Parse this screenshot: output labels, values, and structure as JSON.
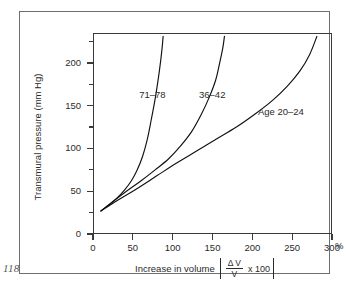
{
  "page": {
    "folio": "118"
  },
  "chart_data": {
    "type": "line",
    "title": "",
    "xlabel": "Increase in volume",
    "xlabel_bracket": {
      "numerator": "Δ V",
      "denominator": "V",
      "multiplier": "x 100"
    },
    "x_unit": "%",
    "ylabel": "Transmural pressure (mm Hg)",
    "xlim": [
      0,
      300
    ],
    "ylim": [
      0,
      235
    ],
    "xticks": [
      0,
      50,
      100,
      150,
      200,
      250,
      300
    ],
    "xtick_labels": [
      "0",
      "50",
      "100",
      "150",
      "200",
      "250",
      "300"
    ],
    "yticks": [
      0,
      50,
      100,
      150,
      200
    ],
    "ytick_labels": [
      "0",
      "50",
      "100",
      "150",
      "200"
    ],
    "y_minor_ticks": [
      25,
      75,
      125,
      175,
      225
    ],
    "grid": false,
    "legend_position": "inline-annotations",
    "series": [
      {
        "name": "71–78",
        "label": "71–78",
        "label_x": 58,
        "label_y": 163,
        "x": [
          10,
          20,
          30,
          40,
          48,
          55,
          62,
          68,
          73,
          78,
          82,
          85,
          87,
          88
        ],
        "y": [
          27,
          34,
          42,
          52,
          62,
          74,
          90,
          110,
          133,
          158,
          182,
          203,
          220,
          231
        ]
      },
      {
        "name": "36–42",
        "label": "36–42",
        "label_x": 133,
        "label_y": 163,
        "x": [
          10,
          25,
          42,
          60,
          78,
          95,
          110,
          124,
          136,
          146,
          154,
          159,
          163,
          165
        ],
        "y": [
          27,
          38,
          50,
          62,
          75,
          88,
          103,
          120,
          140,
          160,
          180,
          200,
          218,
          231
        ]
      },
      {
        "name": "Age 20–24",
        "label": "Age 20–24",
        "label_x": 207,
        "label_y": 143,
        "x": [
          10,
          30,
          55,
          80,
          105,
          130,
          155,
          180,
          203,
          225,
          244,
          260,
          272,
          281
        ],
        "y": [
          27,
          39,
          53,
          68,
          83,
          97,
          111,
          125,
          140,
          156,
          173,
          191,
          210,
          231
        ]
      }
    ]
  }
}
